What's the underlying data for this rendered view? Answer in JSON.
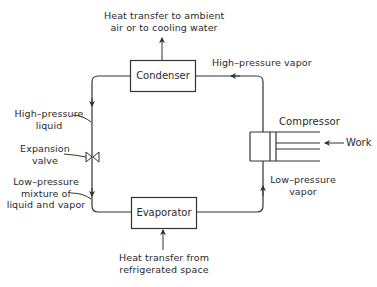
{
  "diagram": {
    "type": "vapor-compression refrigeration cycle",
    "components": {
      "condenser": "Condenser",
      "evaporator": "Evaporator",
      "compressor": "Compressor",
      "expansion_valve": "Expansion valve"
    },
    "labels": {
      "top_heat_line1": "Heat transfer to ambient",
      "top_heat_line2": "air or to cooling water",
      "high_pressure_vapor": "High–pressure vapor",
      "high_pressure_liquid_line1": "High–pressure",
      "high_pressure_liquid_line2": "liquid",
      "expansion_line1": "Expansion",
      "expansion_line2": "valve",
      "low_mix_line1": "Low–pressure",
      "low_mix_line2": "mixture of",
      "low_mix_line3": "liquid and vapor",
      "low_pressure_vapor_line1": "Low–pressure",
      "low_pressure_vapor_line2": "vapor",
      "work": "Work",
      "bottom_heat_line1": "Heat transfer from",
      "bottom_heat_line2": "refrigerated space"
    },
    "colors": {
      "line": "#333333",
      "background": "#ffffff"
    }
  }
}
